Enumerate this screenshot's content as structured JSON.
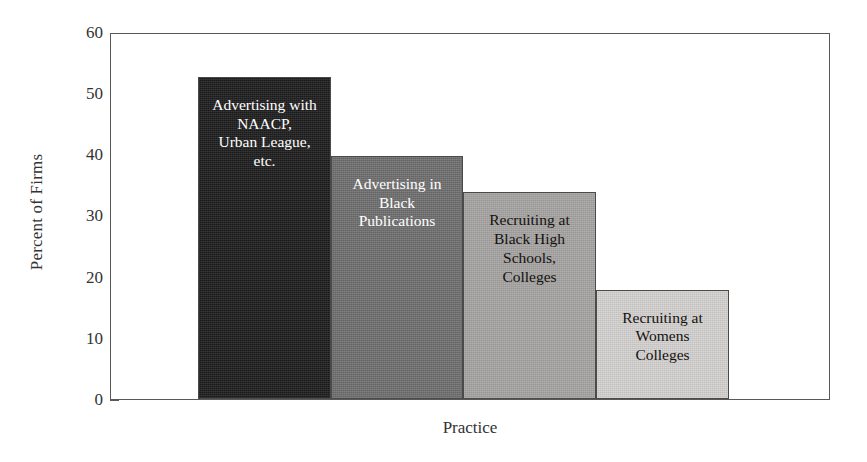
{
  "chart_data": {
    "type": "bar",
    "title": "",
    "xlabel": "Practice",
    "ylabel": "Percent of Firms",
    "ylim": [
      0,
      60
    ],
    "yticks": [
      0,
      10,
      20,
      30,
      40,
      50,
      60
    ],
    "grid": false,
    "legend": "none",
    "categories": [
      "Advertising with\nNAACP,\nUrban League,\netc.",
      "Advertising in\nBlack\nPublications",
      "Recruiting at\nBlack High\nSchools,\nColleges",
      "Recruiting at\nWomens\nColleges"
    ],
    "values": [
      53,
      40,
      34,
      18
    ],
    "bar_colors": [
      "#1e1d1d",
      "#6f6f6f",
      "#a6a5a3",
      "#d5d3d1"
    ],
    "bar_label_colors": [
      "#ffffff",
      "#ffffff",
      "#16110f",
      "#16110f"
    ],
    "axis_color": "#595959"
  },
  "axis": {
    "ylabel": "Percent of Firms",
    "xlabel": "Practice",
    "tick_labels": [
      "0",
      "10",
      "20",
      "30",
      "40",
      "50",
      "60"
    ]
  },
  "bars": [
    {
      "label": "Advertising with\nNAACP,\nUrban League,\netc.",
      "value": 53
    },
    {
      "label": "Advertising in\nBlack\nPublications",
      "value": 40
    },
    {
      "label": "Recruiting at\nBlack High\nSchools,\nColleges",
      "value": 34
    },
    {
      "label": "Recruiting at\nWomens\nColleges",
      "value": 18
    }
  ]
}
